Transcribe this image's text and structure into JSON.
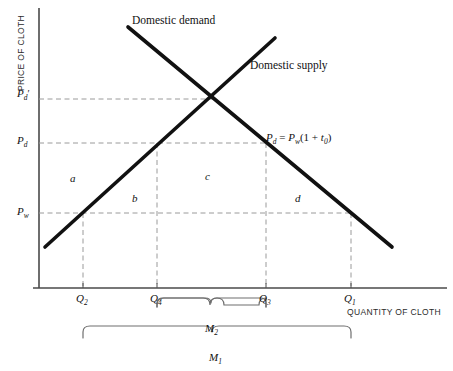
{
  "figure": {
    "type": "supply-demand-tariff-diagram",
    "axes": {
      "y_title": "PRICE OF CLOTH",
      "x_title": "QUANTITY OF CLOTH"
    },
    "curves": [
      {
        "name": "domestic-demand",
        "label": "Domestic demand",
        "slope": "downward"
      },
      {
        "name": "domestic-supply",
        "label": "Domestic supply",
        "slope": "upward"
      }
    ],
    "price_ticks": [
      {
        "id": "pd-prime",
        "base": "P",
        "sub": "d",
        "prime": "′"
      },
      {
        "id": "pd",
        "base": "P",
        "sub": "d",
        "prime": ""
      },
      {
        "id": "pw",
        "base": "P",
        "sub": "w",
        "prime": ""
      }
    ],
    "quantity_ticks": [
      {
        "id": "q2",
        "base": "Q",
        "sub": "2"
      },
      {
        "id": "q4",
        "base": "Q",
        "sub": "4"
      },
      {
        "id": "q3",
        "base": "Q",
        "sub": "3"
      },
      {
        "id": "q1",
        "base": "Q",
        "sub": "1"
      }
    ],
    "regions": [
      {
        "id": "a",
        "label": "a"
      },
      {
        "id": "b",
        "label": "b"
      },
      {
        "id": "c",
        "label": "c"
      },
      {
        "id": "d",
        "label": "d"
      }
    ],
    "tariff_equation": {
      "lhs_base": "P",
      "lhs_sub": "d",
      "equals": " = ",
      "rhs_base": "P",
      "rhs_sub": "w",
      "rhs_tail_open": "(1 + ",
      "rhs_t": "t",
      "rhs_t_sub": "0",
      "rhs_tail_close": ")"
    },
    "braces": [
      {
        "id": "m2",
        "base": "M",
        "sub": "2",
        "from": "q4",
        "to": "q3"
      },
      {
        "id": "m1",
        "base": "M",
        "sub": "1",
        "from": "q2",
        "to": "q1"
      }
    ],
    "colors": {
      "curve": "#111111",
      "axis": "#4a4a4a",
      "dashed": "#8a8a8a",
      "brace": "#6e6e6e",
      "text": "#111111"
    }
  }
}
